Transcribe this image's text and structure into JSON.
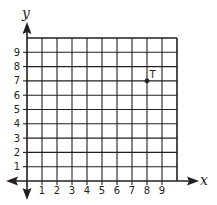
{
  "chart_data": {
    "type": "scatter",
    "title": "",
    "xlabel": "x",
    "ylabel": "y",
    "xlim": [
      0,
      10
    ],
    "ylim": [
      0,
      10
    ],
    "grid": true,
    "x_ticks": [
      "1",
      "2",
      "3",
      "4",
      "5",
      "6",
      "7",
      "8",
      "9"
    ],
    "y_ticks": [
      "1",
      "2",
      "3",
      "4",
      "5",
      "6",
      "7",
      "8",
      "9"
    ],
    "points": [
      {
        "label": "T",
        "x": 8,
        "y": 7
      }
    ]
  },
  "colors": {
    "grid": "#231f20",
    "axis": "#231f20",
    "background": "#ffffff"
  }
}
